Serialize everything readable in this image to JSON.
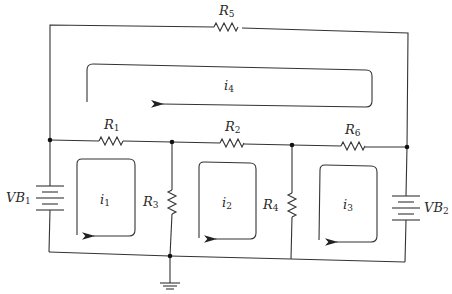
{
  "diagram": {
    "type": "circuit-schematic",
    "resistors": [
      {
        "id": "R5",
        "name": "R",
        "sub": "5"
      },
      {
        "id": "R1",
        "name": "R",
        "sub": "1"
      },
      {
        "id": "R2",
        "name": "R",
        "sub": "2"
      },
      {
        "id": "R6",
        "name": "R",
        "sub": "6"
      },
      {
        "id": "R3",
        "name": "R",
        "sub": "3"
      },
      {
        "id": "R4",
        "name": "R",
        "sub": "4"
      }
    ],
    "batteries": [
      {
        "id": "VB1",
        "name": "VB",
        "sub": "1"
      },
      {
        "id": "VB2",
        "name": "VB",
        "sub": "2"
      }
    ],
    "loops": [
      {
        "id": "i1",
        "name": "i",
        "sub": "1"
      },
      {
        "id": "i2",
        "name": "i",
        "sub": "2"
      },
      {
        "id": "i3",
        "name": "i",
        "sub": "3"
      },
      {
        "id": "i4",
        "name": "i",
        "sub": "4"
      }
    ],
    "ground": "ground"
  }
}
